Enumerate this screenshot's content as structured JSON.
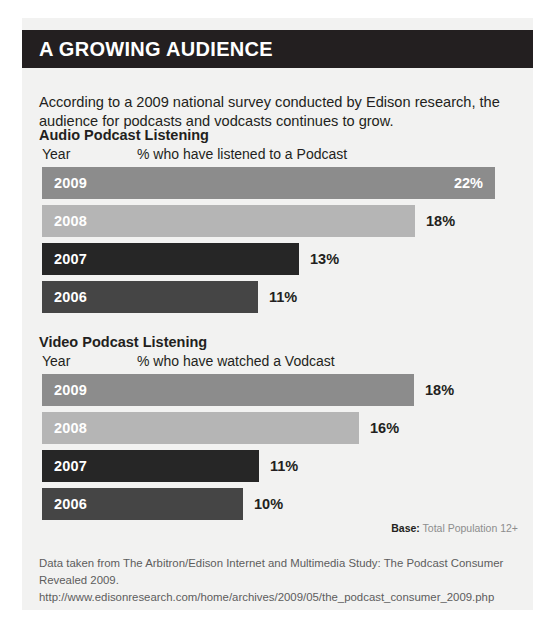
{
  "header": {
    "title": "A GROWING AUDIENCE"
  },
  "intro": {
    "text": "According to a 2009 national survey conducted by Edison research, the audience for podcasts and vodcasts continues to grow."
  },
  "colors": {
    "band": "#231f20",
    "card": "#f2f2f1",
    "bar_2009": "#8c8c8c",
    "bar_2008": "#b5b5b5",
    "bar_2007": "#262626",
    "bar_2006": "#454545",
    "value_text": "#231f20",
    "footnote_text": "#5d5d5d"
  },
  "base_note": {
    "label": "Base:",
    "value": "Total Population 12+"
  },
  "footnote": {
    "text": "Data taken from The Arbitron/Edison Internet and Multimedia Study: The Podcast Consumer Revealed 2009. http://www.edisonresearch.com/home/archives/2009/05/the_podcast_consumer_2009.php"
  },
  "chart_data": [
    {
      "type": "bar",
      "orientation": "horizontal",
      "title": "Audio Podcast Listening",
      "xlabel": "% who have listened to a Podcast",
      "ylabel": "Year",
      "categories": [
        "2009",
        "2008",
        "2007",
        "2006"
      ],
      "values": [
        22,
        18,
        13,
        11
      ],
      "value_labels": [
        "22%",
        "18%",
        "13%",
        "11%"
      ],
      "label_placement": [
        "inside",
        "outside",
        "outside",
        "outside"
      ],
      "bar_colors": [
        "#8c8c8c",
        "#b5b5b5",
        "#262626",
        "#454545"
      ],
      "bar_pixel_widths": [
        453,
        373,
        257,
        216
      ],
      "xlim": [
        0,
        22
      ],
      "grid": false,
      "legend": false
    },
    {
      "type": "bar",
      "orientation": "horizontal",
      "title": "Video Podcast Listening",
      "xlabel": "% who have watched a Vodcast",
      "ylabel": "Year",
      "categories": [
        "2009",
        "2008",
        "2007",
        "2006"
      ],
      "values": [
        18,
        16,
        11,
        10
      ],
      "value_labels": [
        "18%",
        "16%",
        "11%",
        "10%"
      ],
      "label_placement": [
        "outside",
        "outside",
        "outside",
        "outside"
      ],
      "bar_colors": [
        "#8c8c8c",
        "#b5b5b5",
        "#262626",
        "#454545"
      ],
      "bar_pixel_widths": [
        372,
        317,
        217,
        201
      ],
      "xlim": [
        0,
        22
      ],
      "grid": false,
      "legend": false
    }
  ]
}
